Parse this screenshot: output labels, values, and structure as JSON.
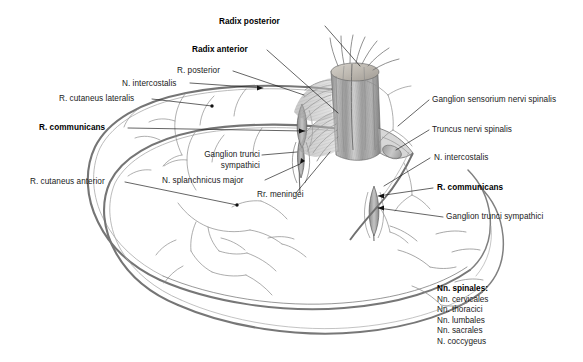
{
  "figure": {
    "kind": "anatomical-illustration",
    "background_color": "#ffffff",
    "ink_color": "#4a4a4a",
    "text_color": "#1a1a1a"
  },
  "labels": {
    "radix_posterior": "Radix posterior",
    "radix_anterior": "Radix anterior",
    "r_posterior": "R. posterior",
    "n_intercostalis_left": "N. intercostalis",
    "r_cutaneus_lateralis": "R. cutaneus lateralis",
    "r_communicans_left": "R. communicans",
    "ganglion_trunci_sympathici_mid_line1": "Ganglion trunci",
    "ganglion_trunci_sympathici_mid_line2": "sympathici",
    "r_cutaneus_anterior": "R. cutaneus anterior",
    "n_splanchnicus_major": "N. splanchnicus major",
    "rr_meningei": "Rr. meningei",
    "ganglion_sensorium_nervi_spinalis": "Ganglion sensorium nervi spinalis",
    "truncus_nervi_spinalis": "Truncus nervi spinalis",
    "n_intercostalis_right": "N. intercostalis",
    "r_communicans_right": "R. communicans",
    "ganglion_trunci_sympathici_right": "Ganglion trunci sympathici"
  },
  "legend": {
    "title": "Nn. spinales:",
    "items": [
      "Nn. cervicales",
      "Nn. thoracici",
      "Nn. lumbales",
      "Nn. sacrales",
      "N. coccygeus"
    ]
  }
}
